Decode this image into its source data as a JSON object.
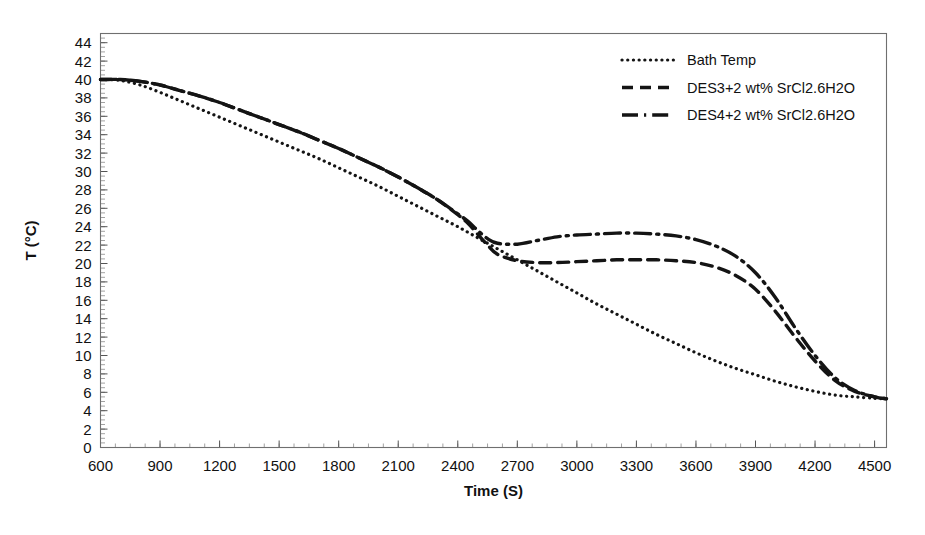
{
  "chart_data": {
    "type": "line",
    "title": "",
    "xlabel": "Time (S)",
    "ylabel": "T (°C)",
    "xlim": [
      600,
      4560
    ],
    "ylim": [
      0,
      45
    ],
    "xticks": [
      600,
      900,
      1200,
      1500,
      1800,
      2100,
      2400,
      2700,
      3000,
      3300,
      3600,
      3900,
      4200,
      4500
    ],
    "yticks": [
      0,
      2,
      4,
      6,
      8,
      10,
      12,
      14,
      16,
      18,
      20,
      22,
      24,
      26,
      28,
      30,
      32,
      34,
      36,
      38,
      40,
      42,
      44
    ],
    "x_minor_step": 75,
    "y_minor_step": 0.5,
    "grid": false,
    "legend_position": "top-right",
    "series": [
      {
        "name": "Bath Temp",
        "style": "dotted",
        "color": "#141414",
        "x": [
          600,
          700,
          800,
          900,
          1000,
          1100,
          1200,
          1300,
          1400,
          1500,
          1600,
          1700,
          1800,
          1900,
          2000,
          2100,
          2200,
          2300,
          2400,
          2500,
          2600,
          2700,
          2800,
          2900,
          3000,
          3100,
          3200,
          3300,
          3400,
          3500,
          3600,
          3700,
          3800,
          3900,
          4000,
          4100,
          4200,
          4300,
          4400,
          4500,
          4560
        ],
        "y": [
          40.0,
          39.9,
          39.4,
          38.6,
          37.7,
          36.8,
          35.9,
          35.0,
          34.1,
          33.2,
          32.3,
          31.4,
          30.4,
          29.4,
          28.4,
          27.3,
          26.2,
          25.1,
          24.0,
          22.8,
          21.6,
          20.4,
          19.2,
          18.0,
          16.8,
          15.6,
          14.5,
          13.4,
          12.3,
          11.3,
          10.3,
          9.4,
          8.6,
          7.9,
          7.2,
          6.6,
          6.1,
          5.7,
          5.5,
          5.35,
          5.3
        ]
      },
      {
        "name": "DES3+2 wt% SrCl2.6H2O",
        "style": "dashed",
        "color": "#141414",
        "x": [
          600,
          700,
          800,
          900,
          1000,
          1100,
          1200,
          1300,
          1400,
          1500,
          1600,
          1700,
          1800,
          1900,
          2000,
          2100,
          2200,
          2300,
          2400,
          2450,
          2500,
          2550,
          2600,
          2700,
          2800,
          2900,
          3000,
          3100,
          3200,
          3300,
          3400,
          3500,
          3600,
          3700,
          3800,
          3900,
          4000,
          4100,
          4200,
          4300,
          4400,
          4500,
          4560
        ],
        "y": [
          40.0,
          40.0,
          39.8,
          39.4,
          38.8,
          38.2,
          37.5,
          36.7,
          35.9,
          35.1,
          34.3,
          33.4,
          32.5,
          31.5,
          30.5,
          29.4,
          28.2,
          26.9,
          25.3,
          24.4,
          23.2,
          22.0,
          21.0,
          20.3,
          20.1,
          20.1,
          20.2,
          20.3,
          20.4,
          20.4,
          20.4,
          20.3,
          20.1,
          19.6,
          18.7,
          17.2,
          14.8,
          12.0,
          9.4,
          7.3,
          6.1,
          5.5,
          5.3
        ]
      },
      {
        "name": "DES4+2 wt% SrCl2.6H2O",
        "style": "dash-dot",
        "color": "#141414",
        "x": [
          600,
          700,
          800,
          900,
          1000,
          1100,
          1200,
          1300,
          1400,
          1500,
          1600,
          1700,
          1800,
          1900,
          2000,
          2100,
          2200,
          2300,
          2400,
          2450,
          2500,
          2550,
          2600,
          2700,
          2800,
          2900,
          3000,
          3100,
          3200,
          3300,
          3400,
          3500,
          3600,
          3700,
          3800,
          3900,
          4000,
          4100,
          4200,
          4300,
          4400,
          4500,
          4560
        ],
        "y": [
          40.0,
          40.0,
          39.8,
          39.4,
          38.8,
          38.2,
          37.5,
          36.7,
          35.9,
          35.1,
          34.3,
          33.4,
          32.5,
          31.5,
          30.5,
          29.4,
          28.2,
          26.9,
          25.4,
          24.6,
          23.6,
          22.7,
          22.2,
          22.1,
          22.5,
          22.9,
          23.1,
          23.2,
          23.3,
          23.3,
          23.2,
          23.0,
          22.6,
          21.9,
          20.8,
          19.0,
          16.3,
          13.0,
          10.0,
          7.6,
          6.2,
          5.5,
          5.3
        ]
      }
    ]
  },
  "legend": {
    "entries": [
      {
        "label": "Bath Temp"
      },
      {
        "label": "DES3+2 wt% SrCl2.6H2O"
      },
      {
        "label": "DES4+2 wt% SrCl2.6H2O"
      }
    ]
  },
  "axes": {
    "x_title": "Time (S)",
    "y_title": "T (°C)"
  }
}
